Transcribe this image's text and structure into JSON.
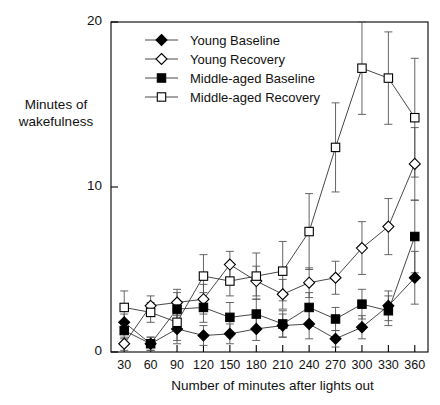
{
  "chart_data": {
    "type": "line",
    "title": "",
    "xlabel": "Number of minutes after lights out",
    "ylabel": "Minutes of\nwakefulness",
    "ylabel_line1": "Minutes of",
    "ylabel_line2": "wakefulness",
    "categories": [
      30,
      60,
      90,
      120,
      150,
      180,
      210,
      240,
      270,
      300,
      330,
      360
    ],
    "x": [
      30,
      60,
      90,
      120,
      150,
      180,
      210,
      240,
      270,
      300,
      330,
      360
    ],
    "xlim": [
      15,
      375
    ],
    "ylim": [
      0,
      20
    ],
    "yticks": [
      0,
      10,
      20
    ],
    "ytick_labels": [
      "0",
      "10",
      "20"
    ],
    "xtick_labels": [
      "30",
      "60",
      "90",
      "120",
      "150",
      "180",
      "210",
      "240",
      "270",
      "300",
      "330",
      "360"
    ],
    "grid": false,
    "legend_position": "top-left",
    "series": [
      {
        "name": "Young Baseline",
        "marker": "filled-diamond",
        "values": [
          1.8,
          0.5,
          1.4,
          1.0,
          1.1,
          1.4,
          1.6,
          1.7,
          0.8,
          1.5,
          2.8,
          4.5
        ],
        "errors": [
          0.5,
          0.4,
          0.9,
          0.6,
          0.6,
          0.7,
          0.7,
          0.9,
          0.5,
          0.7,
          0.9,
          1.6
        ]
      },
      {
        "name": "Young Recovery",
        "marker": "open-diamond",
        "values": [
          0.5,
          2.8,
          3.0,
          3.2,
          5.3,
          4.3,
          3.5,
          4.2,
          4.5,
          6.3,
          7.6,
          11.4
        ],
        "errors": [
          0.4,
          0.6,
          0.8,
          0.9,
          0.8,
          0.9,
          0.9,
          0.9,
          1.0,
          1.6,
          1.7,
          2.2
        ]
      },
      {
        "name": "Middle-aged Baseline",
        "marker": "filled-square",
        "values": [
          1.3,
          0.5,
          2.6,
          2.7,
          2.1,
          2.3,
          1.7,
          2.7,
          2.0,
          2.9,
          2.5,
          7.0
        ],
        "errors": [
          0.5,
          0.4,
          1.0,
          0.9,
          0.9,
          0.9,
          0.8,
          0.9,
          0.7,
          0.9,
          0.9,
          2.2
        ]
      },
      {
        "name": "Middle-aged Recovery",
        "marker": "open-square",
        "values": [
          2.7,
          2.4,
          1.8,
          4.6,
          4.3,
          4.6,
          4.9,
          7.3,
          12.4,
          17.2,
          16.6,
          14.2
        ],
        "errors": [
          1.0,
          0.6,
          1.1,
          1.3,
          0.9,
          1.4,
          1.8,
          2.3,
          2.7,
          2.8,
          2.8,
          3.6
        ]
      }
    ]
  },
  "axes": {
    "y_label_line1": "Minutes of",
    "y_label_line2": "wakefulness",
    "x_label": "Number of minutes after lights out"
  }
}
